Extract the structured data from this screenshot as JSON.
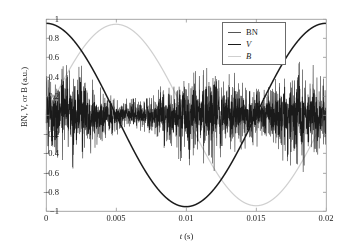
{
  "chart_data": {
    "type": "line",
    "title": "",
    "xlabel": "t (s)",
    "ylabel": "BN, V, or B (a.u.)",
    "xlim": [
      0,
      0.02
    ],
    "ylim": [
      -1,
      1
    ],
    "grid": false,
    "legend_position": "top-right",
    "xticks": [
      "0",
      "0.005",
      "0.01",
      "0.015",
      "0.02"
    ],
    "xtick_values": [
      0,
      0.005,
      0.01,
      0.015,
      0.02
    ],
    "yticks": [
      "1",
      "0.8",
      "0.6",
      "0.4",
      "0.2",
      "0",
      "−0.2",
      "−0.4",
      "−0.6",
      "−0.8",
      "−1"
    ],
    "ytick_values": [
      1,
      0.8,
      0.6,
      0.4,
      0.2,
      0,
      -0.2,
      -0.4,
      -0.6,
      -0.8,
      -1
    ],
    "series": [
      {
        "name": "BN",
        "label": "BN",
        "kind": "noise-burst",
        "color": "#1a1a1a",
        "linewidth": 0.55,
        "amplitude": 0.68,
        "burst_centers": [
          0.0016,
          0.0112,
          0.0182
        ],
        "burst_widths": [
          0.003,
          0.004,
          0.0028
        ],
        "floor": 0.07,
        "sample_count": 3000,
        "seed": 20250411,
        "description": "Barkhausen noise bursts peaking near the zero crossings of B"
      },
      {
        "name": "V",
        "label": "V",
        "italic_label": true,
        "kind": "cosine",
        "color": "#1a1a1a",
        "linewidth": 1.5,
        "amplitude": 0.955,
        "period": 0.02,
        "phase_deg": 0,
        "key_points": [
          {
            "t": 0,
            "y": 0.955
          },
          {
            "t": 0.005,
            "y": 0
          },
          {
            "t": 0.01,
            "y": -0.955
          },
          {
            "t": 0.015,
            "y": 0
          },
          {
            "t": 0.02,
            "y": 0.94
          }
        ]
      },
      {
        "name": "B",
        "label": "B",
        "italic_label": true,
        "kind": "sine",
        "color": "#cfcfcf",
        "linewidth": 1.2,
        "amplitude": 0.945,
        "period": 0.02,
        "phase_deg": -90,
        "key_points": [
          {
            "t": 0,
            "y": 0
          },
          {
            "t": 0.005,
            "y": 0.945
          },
          {
            "t": 0.01,
            "y": 0
          },
          {
            "t": 0.015,
            "y": -0.945
          },
          {
            "t": 0.02,
            "y": 0
          }
        ]
      }
    ]
  },
  "axes": {
    "frame_color": "#8a8a8a",
    "text_color": "#1a1a1a",
    "background": "#ffffff"
  },
  "legend": {
    "entries": [
      {
        "label": "BN",
        "color": "#555555",
        "italic": false
      },
      {
        "label": "V",
        "color": "#1a1a1a",
        "italic": true
      },
      {
        "label": "B",
        "color": "#cfcfcf",
        "italic": true
      }
    ]
  }
}
